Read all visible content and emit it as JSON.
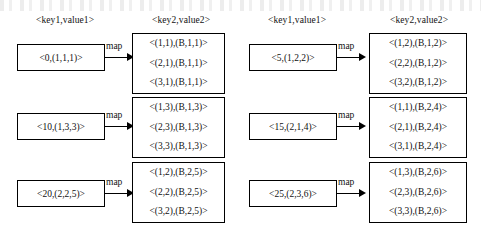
{
  "diagram": {
    "headers": [
      {
        "text": "<key1,value1>",
        "x": 36,
        "y": 15
      },
      {
        "text": "<key2,value2>",
        "x": 152,
        "y": 15
      },
      {
        "text": "<key1,value1>",
        "x": 268,
        "y": 15
      },
      {
        "text": "<key2,value2>",
        "x": 390,
        "y": 15
      }
    ],
    "map_label": "map",
    "groups": [
      {
        "source": {
          "text": "<0,(1,1,1)>",
          "x": 17,
          "y": 44,
          "w": 88,
          "h": 27
        },
        "arrow": {
          "x": 105,
          "y": 57,
          "len": 22,
          "label_x": 106,
          "label_y": 41
        },
        "target": {
          "x": 132,
          "y": 33,
          "w": 93,
          "h": 61,
          "rows": [
            "<(1,1),(B,1,1)>",
            "<(2,1),(B,1,1)>",
            "<(3,1),(B,1,1)>"
          ]
        }
      },
      {
        "source": {
          "text": "<10,(1,3,3)>",
          "x": 17,
          "y": 113,
          "w": 88,
          "h": 27
        },
        "arrow": {
          "x": 105,
          "y": 126,
          "len": 22,
          "label_x": 106,
          "label_y": 110
        },
        "target": {
          "x": 132,
          "y": 97,
          "w": 93,
          "h": 61,
          "rows": [
            "<(1,3),(B,1,3)>",
            "<(2,3),(B,1,3)>",
            "<(3,3),(B,1,3)>"
          ]
        }
      },
      {
        "source": {
          "text": "<20,(2,2,5)>",
          "x": 17,
          "y": 180,
          "w": 88,
          "h": 27
        },
        "arrow": {
          "x": 105,
          "y": 193,
          "len": 22,
          "label_x": 106,
          "label_y": 177
        },
        "target": {
          "x": 132,
          "y": 162,
          "w": 93,
          "h": 61,
          "rows": [
            "<(1,2),(B,2,5)>",
            "<(2,2),(B,2,5)>",
            "<(3,2),(B,2,5)>"
          ]
        }
      },
      {
        "source": {
          "text": "<5,(1,2,2)>",
          "x": 249,
          "y": 44,
          "w": 88,
          "h": 27
        },
        "arrow": {
          "x": 337,
          "y": 57,
          "len": 22,
          "label_x": 338,
          "label_y": 41
        },
        "target": {
          "x": 369,
          "y": 33,
          "w": 98,
          "h": 61,
          "rows": [
            "<(1,2),(B,1,2)>",
            "<(2,2),(B,1,2)>",
            "<(3,2),(B,1,2)>"
          ]
        }
      },
      {
        "source": {
          "text": "<15,(2,1,4)>",
          "x": 249,
          "y": 113,
          "w": 88,
          "h": 27
        },
        "arrow": {
          "x": 337,
          "y": 126,
          "len": 22,
          "label_x": 338,
          "label_y": 110
        },
        "target": {
          "x": 369,
          "y": 97,
          "w": 98,
          "h": 61,
          "rows": [
            "<(1,1),(B,2,4)>",
            "<(2,1),(B,2,4)>",
            "<(3,1),(B,2,4)>"
          ]
        }
      },
      {
        "source": {
          "text": "<25,(2,3,6)>",
          "x": 249,
          "y": 180,
          "w": 88,
          "h": 27
        },
        "arrow": {
          "x": 337,
          "y": 193,
          "len": 22,
          "label_x": 338,
          "label_y": 177
        },
        "target": {
          "x": 369,
          "y": 162,
          "w": 98,
          "h": 61,
          "rows": [
            "<(1,3),(B,2,6)>",
            "<(2,3),(B,2,6)>",
            "<(3,3),(B,2,6)>"
          ]
        }
      }
    ]
  }
}
